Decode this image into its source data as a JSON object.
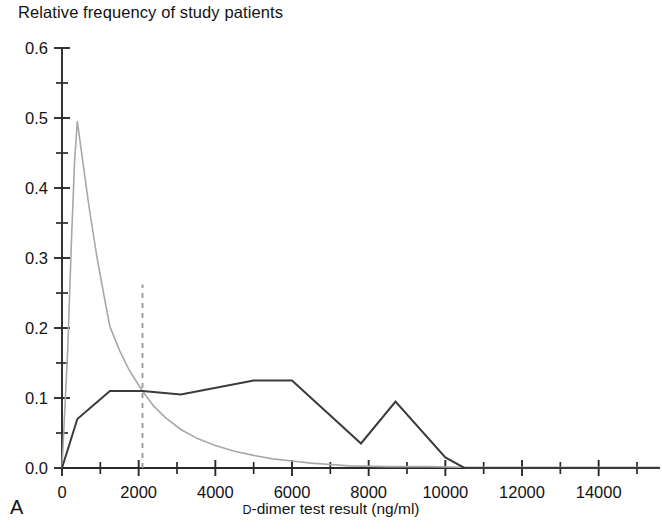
{
  "figure": {
    "panel_letter": "A",
    "y_axis_caption": "Relative frequency of study patients",
    "x_axis_title_prefix": "D",
    "x_axis_title_rest": "-dimer test result (ng/ml)"
  },
  "colors": {
    "dark_series": "#3b3b3b",
    "light_series": "#a8a8a8",
    "reference_line": "#9a9a9a",
    "axis": "#2a2a2a",
    "text": "#131313",
    "background": "#ffffff"
  },
  "chart_data": {
    "type": "line",
    "title": "",
    "xlabel": "D-dimer test result (ng/ml)",
    "ylabel": "Relative frequency of study patients",
    "xlim": [
      0,
      15600
    ],
    "ylim": [
      0.0,
      0.6
    ],
    "grid": false,
    "legend": "none",
    "x_ticks": [
      0,
      2000,
      4000,
      6000,
      8000,
      10000,
      12000,
      14000
    ],
    "x_tick_labels": [
      "0",
      "2000",
      "4000",
      "6000",
      "8000",
      "10000",
      "12000",
      "14000"
    ],
    "x_minor_tick_interval": 1000,
    "y_ticks": [
      0.0,
      0.1,
      0.2,
      0.3,
      0.4,
      0.5,
      0.6
    ],
    "y_tick_labels": [
      "0.0",
      "0.1",
      "0.2",
      "0.3",
      "0.4",
      "0.5",
      "0.6"
    ],
    "y_minor_tick_interval": 0.05,
    "annotations": [
      {
        "name": "cutoff-reference-line",
        "type": "vline",
        "x": 2100,
        "y_from": 0.0,
        "y_to": 0.262,
        "style": "dashed"
      }
    ],
    "series": [
      {
        "name": "light-curve",
        "style": "solid-thin-gray",
        "points": [
          [
            0,
            0.0
          ],
          [
            150,
            0.17
          ],
          [
            250,
            0.33
          ],
          [
            330,
            0.44
          ],
          [
            400,
            0.495
          ],
          [
            500,
            0.455
          ],
          [
            700,
            0.375
          ],
          [
            900,
            0.305
          ],
          [
            1100,
            0.245
          ],
          [
            1250,
            0.202
          ],
          [
            1500,
            0.168
          ],
          [
            1750,
            0.14
          ],
          [
            2100,
            0.11
          ],
          [
            2400,
            0.088
          ],
          [
            2700,
            0.072
          ],
          [
            3100,
            0.055
          ],
          [
            3500,
            0.043
          ],
          [
            4000,
            0.032
          ],
          [
            4500,
            0.024
          ],
          [
            5000,
            0.018
          ],
          [
            5500,
            0.013
          ],
          [
            6000,
            0.01
          ],
          [
            6500,
            0.007
          ],
          [
            7000,
            0.005
          ],
          [
            7500,
            0.003
          ],
          [
            8500,
            0.002
          ],
          [
            9500,
            0.002
          ],
          [
            10500,
            0.001
          ],
          [
            12000,
            0.001
          ],
          [
            15600,
            0.001
          ]
        ]
      },
      {
        "name": "dark-curve",
        "style": "solid-dark-polyline",
        "points": [
          [
            0,
            0.0
          ],
          [
            400,
            0.07
          ],
          [
            1250,
            0.11
          ],
          [
            2100,
            0.11
          ],
          [
            3100,
            0.105
          ],
          [
            5000,
            0.125
          ],
          [
            6000,
            0.125
          ],
          [
            7800,
            0.035
          ],
          [
            8700,
            0.095
          ],
          [
            10000,
            0.015
          ],
          [
            10500,
            0.0
          ],
          [
            12000,
            0.0
          ],
          [
            15600,
            0.0
          ]
        ]
      }
    ]
  }
}
